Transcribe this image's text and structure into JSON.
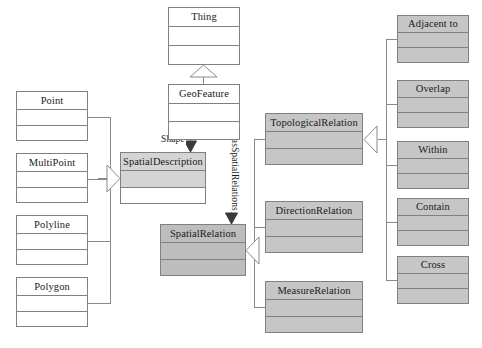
{
  "diagram": {
    "type": "uml-class-diagram",
    "background": "#ffffff",
    "stroke_color": "#808080",
    "text_color": "#1a1a1a",
    "fills": {
      "white": "#ffffff",
      "gray_light": "#d4d4d4",
      "gray_medium": "#c6c6c6",
      "gray_dark": "#bdbdbd"
    }
  },
  "classes": [
    {
      "id": "thing",
      "name": "Thing",
      "x": 168,
      "y": 7,
      "w": 72,
      "h": 58,
      "title_h": 19,
      "rows": 2,
      "fill": "white",
      "title_fill": "white"
    },
    {
      "id": "geofeature",
      "name": "GeoFeature",
      "x": 168,
      "y": 84,
      "w": 72,
      "h": 56,
      "title_h": 19,
      "rows": 2,
      "fill": "white",
      "title_fill": "white"
    },
    {
      "id": "point",
      "name": "Point",
      "x": 16,
      "y": 91,
      "w": 72,
      "h": 50,
      "title_h": 18,
      "rows": 2,
      "fill": "white",
      "title_fill": "white"
    },
    {
      "id": "multipoint",
      "name": "MultiPoint",
      "x": 16,
      "y": 153,
      "w": 72,
      "h": 50,
      "title_h": 18,
      "rows": 2,
      "fill": "white",
      "title_fill": "white"
    },
    {
      "id": "polyline",
      "name": "Polyline",
      "x": 16,
      "y": 215,
      "w": 72,
      "h": 50,
      "title_h": 18,
      "rows": 2,
      "fill": "white",
      "title_fill": "white"
    },
    {
      "id": "polygon",
      "name": "Polygon",
      "x": 16,
      "y": 277,
      "w": 72,
      "h": 50,
      "title_h": 18,
      "rows": 2,
      "fill": "white",
      "title_fill": "white"
    },
    {
      "id": "spatialdescription",
      "name": "SpatialDescription",
      "x": 120,
      "y": 152,
      "w": 86,
      "h": 52,
      "title_h": 18,
      "rows": 2,
      "fill": "mixed",
      "title_fill": "gray_light"
    },
    {
      "id": "spatialrelation",
      "name": "SpatialRelation",
      "x": 160,
      "y": 224,
      "w": 86,
      "h": 52,
      "title_h": 18,
      "rows": 2,
      "fill": "gray_dark",
      "title_fill": "gray_dark"
    },
    {
      "id": "topologicalrelation",
      "name": "TopologicalRelation",
      "x": 265,
      "y": 113,
      "w": 98,
      "h": 52,
      "title_h": 18,
      "rows": 2,
      "fill": "gray_medium",
      "title_fill": "gray_medium"
    },
    {
      "id": "directionrelation",
      "name": "DirectionRelation",
      "x": 265,
      "y": 201,
      "w": 98,
      "h": 52,
      "title_h": 18,
      "rows": 2,
      "fill": "gray_medium",
      "title_fill": "gray_medium"
    },
    {
      "id": "measurerelation",
      "name": "MeasureRelation",
      "x": 265,
      "y": 281,
      "w": 98,
      "h": 52,
      "title_h": 18,
      "rows": 2,
      "fill": "gray_medium",
      "title_fill": "gray_medium"
    },
    {
      "id": "adjacentto",
      "name": "Adjacent to",
      "x": 397,
      "y": 15,
      "w": 72,
      "h": 48,
      "title_h": 17,
      "rows": 2,
      "fill": "gray_medium",
      "title_fill": "gray_medium"
    },
    {
      "id": "overlap",
      "name": "Overlap",
      "x": 397,
      "y": 80,
      "w": 72,
      "h": 48,
      "title_h": 17,
      "rows": 2,
      "fill": "gray_medium",
      "title_fill": "gray_medium"
    },
    {
      "id": "within",
      "name": "Within",
      "x": 397,
      "y": 141,
      "w": 72,
      "h": 48,
      "title_h": 17,
      "rows": 2,
      "fill": "gray_medium",
      "title_fill": "gray_medium"
    },
    {
      "id": "contain",
      "name": "Contain",
      "x": 397,
      "y": 198,
      "w": 72,
      "h": 48,
      "title_h": 17,
      "rows": 2,
      "fill": "gray_medium",
      "title_fill": "gray_medium"
    },
    {
      "id": "cross",
      "name": "Cross",
      "x": 397,
      "y": 256,
      "w": 72,
      "h": 48,
      "title_h": 17,
      "rows": 2,
      "fill": "gray_medium",
      "title_fill": "gray_medium"
    }
  ],
  "edge_labels": {
    "shape": "Shape",
    "has_spatial_relations": "hasSpatialRelations"
  },
  "relationships": [
    {
      "from": "geofeature",
      "to": "thing",
      "kind": "generalization"
    },
    {
      "from": "point",
      "to": "spatialdescription",
      "kind": "generalization"
    },
    {
      "from": "multipoint",
      "to": "spatialdescription",
      "kind": "generalization"
    },
    {
      "from": "polyline",
      "to": "spatialdescription",
      "kind": "generalization"
    },
    {
      "from": "polygon",
      "to": "spatialdescription",
      "kind": "generalization"
    },
    {
      "from": "geofeature",
      "to": "spatialdescription",
      "kind": "association",
      "label": "Shape"
    },
    {
      "from": "geofeature",
      "to": "spatialrelation",
      "kind": "association",
      "label": "hasSpatialRelations"
    },
    {
      "from": "topologicalrelation",
      "to": "spatialrelation",
      "kind": "generalization"
    },
    {
      "from": "directionrelation",
      "to": "spatialrelation",
      "kind": "generalization"
    },
    {
      "from": "measurerelation",
      "to": "spatialrelation",
      "kind": "generalization"
    },
    {
      "from": "adjacentto",
      "to": "topologicalrelation",
      "kind": "generalization"
    },
    {
      "from": "overlap",
      "to": "topologicalrelation",
      "kind": "generalization"
    },
    {
      "from": "within",
      "to": "topologicalrelation",
      "kind": "generalization"
    },
    {
      "from": "contain",
      "to": "topologicalrelation",
      "kind": "generalization"
    },
    {
      "from": "cross",
      "to": "topologicalrelation",
      "kind": "generalization"
    }
  ]
}
